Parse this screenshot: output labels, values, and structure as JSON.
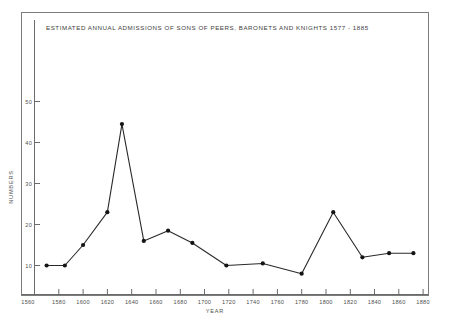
{
  "chart_data": {
    "type": "line",
    "title": "ESTIMATED ANNUAL ADMISSIONS OF SONS OF PEERS, BARONETS AND KNIGHTS 1577 - 1885",
    "xlabel": "YEAR",
    "ylabel": "NUMBERS",
    "xlim": [
      1560,
      1890
    ],
    "ylim": [
      0,
      55
    ],
    "grid": false,
    "legend": null,
    "xticks": [
      1560,
      1580,
      1600,
      1620,
      1640,
      1660,
      1680,
      1700,
      1720,
      1740,
      1760,
      1780,
      1800,
      1820,
      1840,
      1860,
      1880
    ],
    "xtick_labels": [
      "1560",
      "1580",
      "1600",
      "1620",
      "1640",
      "1660",
      "1680",
      "1700",
      "1720",
      "1740",
      "1760",
      "1780",
      "1800",
      "1820",
      "1840",
      "1860",
      "1880"
    ],
    "yticks": [
      10,
      20,
      30,
      40,
      50
    ],
    "ytick_labels": [
      "10",
      "20",
      "30",
      "40",
      "50"
    ],
    "x": [
      1570,
      1585,
      1600,
      1620,
      1632,
      1650,
      1670,
      1690,
      1718,
      1748,
      1780,
      1806,
      1830,
      1852,
      1872
    ],
    "values": [
      10,
      10,
      15,
      23,
      44.5,
      16,
      18.5,
      15.5,
      10,
      10.5,
      8,
      23,
      12,
      13,
      13
    ],
    "series": [
      {
        "name": "Estimated annual admissions",
        "points": [
          {
            "x": 1570,
            "y": 10
          },
          {
            "x": 1585,
            "y": 10
          },
          {
            "x": 1600,
            "y": 15
          },
          {
            "x": 1620,
            "y": 23
          },
          {
            "x": 1632,
            "y": 44.5
          },
          {
            "x": 1650,
            "y": 16
          },
          {
            "x": 1670,
            "y": 18.5
          },
          {
            "x": 1690,
            "y": 15.5
          },
          {
            "x": 1718,
            "y": 10
          },
          {
            "x": 1748,
            "y": 10.5
          },
          {
            "x": 1780,
            "y": 8
          },
          {
            "x": 1806,
            "y": 23
          },
          {
            "x": 1830,
            "y": 12
          },
          {
            "x": 1852,
            "y": 13
          },
          {
            "x": 1872,
            "y": 13
          }
        ]
      }
    ],
    "colors": {
      "line": "#2a2a2a",
      "marker": "#141414",
      "axis": "#6b6b6b",
      "frame": "#7c7c7c",
      "background": "#ffffff",
      "text": "#4a4a4a"
    }
  }
}
